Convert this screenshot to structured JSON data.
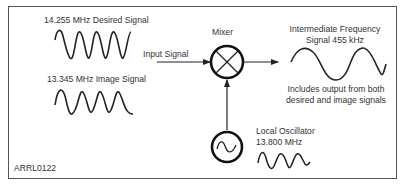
{
  "diagram": {
    "desired_signal_label": "14.255 MHz Desired Signal",
    "image_signal_label": "13.345 MHz Image Signal",
    "input_label": "Input Signal",
    "mixer_label": "Mixer",
    "if_label_line1": "Intermediate Frequency",
    "if_label_line2": "Signal  455 kHz",
    "if_note_line1": "Includes output from both",
    "if_note_line2": "desired and image signals",
    "lo_label_line1": "Local Oscillator",
    "lo_label_line2": "13.800 MHz",
    "figure_id": "ARRL0122"
  }
}
